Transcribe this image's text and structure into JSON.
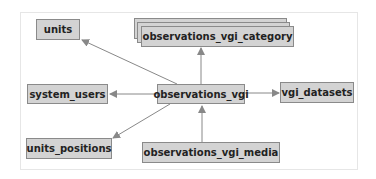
{
  "diagram": {
    "type": "entity-relationship",
    "center": "observations_vgi",
    "nodes": [
      {
        "id": "units",
        "label": "units"
      },
      {
        "id": "observations_vgi_category",
        "label": "observations_vgi_category",
        "stacked": true
      },
      {
        "id": "system_users",
        "label": "system_users"
      },
      {
        "id": "observations_vgi",
        "label": "observations_vgi"
      },
      {
        "id": "vgi_datasets",
        "label": "vgi_datasets"
      },
      {
        "id": "units_positions",
        "label": "units_positions"
      },
      {
        "id": "observations_vgi_media",
        "label": "observations_vgi_media"
      }
    ],
    "edges": [
      {
        "from": "observations_vgi",
        "to": "units"
      },
      {
        "from": "observations_vgi",
        "to": "observations_vgi_category"
      },
      {
        "from": "observations_vgi",
        "to": "system_users"
      },
      {
        "from": "observations_vgi",
        "to": "vgi_datasets"
      },
      {
        "from": "observations_vgi",
        "to": "units_positions"
      },
      {
        "from": "observations_vgi_media",
        "to": "observations_vgi"
      }
    ]
  },
  "colors": {
    "node_fill": "#d3d3d3",
    "node_border": "#8a8a8a",
    "edge": "#888888",
    "frame": "#e6e6e6"
  }
}
